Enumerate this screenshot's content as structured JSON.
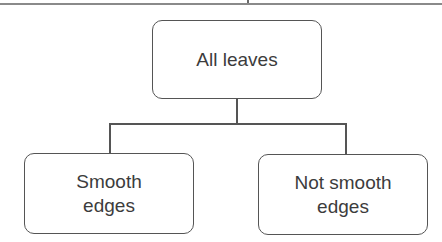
{
  "diagram": {
    "type": "tree",
    "root": {
      "label": "All leaves"
    },
    "children": [
      {
        "label_line1": "Smooth",
        "label_line2": "edges"
      },
      {
        "label_line1": "Not smooth",
        "label_line2": "edges"
      }
    ]
  }
}
